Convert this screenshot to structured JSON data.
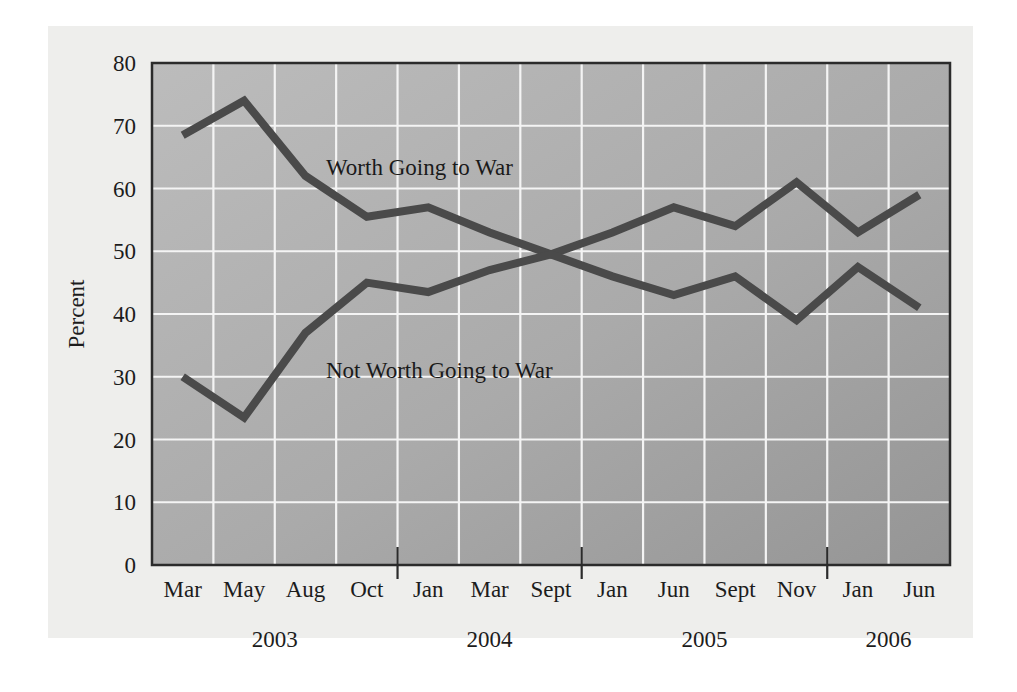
{
  "chart_data": {
    "type": "line",
    "title": "",
    "subtitle": "",
    "xlabel": "",
    "ylabel": "Percent",
    "ylim": [
      0,
      80
    ],
    "ytick_step": 10,
    "yticks": [
      "0",
      "10",
      "20",
      "30",
      "40",
      "50",
      "60",
      "70",
      "80"
    ],
    "grid": true,
    "legend_position": "inline-annotation",
    "categories": [
      "Mar",
      "May",
      "Aug",
      "Oct",
      "Jan",
      "Mar",
      "Sept",
      "Jan",
      "Jun",
      "Sept",
      "Nov",
      "Jan",
      "Jun"
    ],
    "year_groups": [
      {
        "label": "2003",
        "start_index": 0,
        "end_index": 3
      },
      {
        "label": "2004",
        "start_index": 4,
        "end_index": 6
      },
      {
        "label": "2005",
        "start_index": 7,
        "end_index": 10
      },
      {
        "label": "2006",
        "start_index": 11,
        "end_index": 12
      }
    ],
    "series": [
      {
        "name": "Worth Going to War",
        "annotation": "Worth Going to War",
        "color": "#4a4a4a",
        "values": [
          68.5,
          74,
          62,
          55.5,
          57,
          53,
          49.5,
          53,
          57,
          54,
          61,
          53,
          59
        ]
      },
      {
        "name": "Not Worth Going to War",
        "annotation": "Not Worth Going to War",
        "color": "#4a4a4a",
        "values": [
          30,
          23.5,
          37,
          45,
          43.5,
          47,
          49.5,
          46,
          43,
          46,
          39,
          47.5,
          41
        ]
      }
    ],
    "colors": {
      "plot_background_top": "#b5b5b5",
      "plot_background_bottom": "#9c9c9c",
      "gridline": "#f4f4f4",
      "line": "#4a4a4a",
      "axis": "#2b2b2b",
      "page_background": "#eeeeec",
      "text": "#1c1c1c"
    }
  }
}
